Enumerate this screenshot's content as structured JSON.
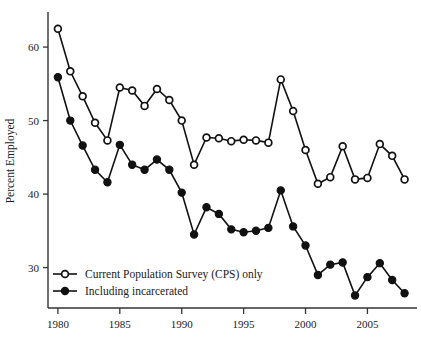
{
  "chart_data": {
    "type": "line",
    "title": "",
    "xlabel": "",
    "ylabel": "Percent Employed",
    "xlim": [
      1979.2,
      2008.6
    ],
    "ylim": [
      24.5,
      64.5
    ],
    "grid": false,
    "legend_position": "bottom-left",
    "x_ticks": [
      1980,
      1985,
      1990,
      1995,
      2000,
      2005
    ],
    "y_ticks": [
      30,
      40,
      50,
      60
    ],
    "x": [
      1980,
      1981,
      1982,
      1983,
      1984,
      1985,
      1986,
      1987,
      1988,
      1989,
      1990,
      1991,
      1992,
      1993,
      1994,
      1995,
      1996,
      1997,
      1998,
      1999,
      2000,
      2001,
      2002,
      2003,
      2004,
      2005,
      2006,
      2007,
      2008
    ],
    "series": [
      {
        "name": "Current Population Survey (CPS) only",
        "marker": "open-circle",
        "values": [
          62.5,
          56.7,
          53.3,
          49.7,
          47.3,
          54.5,
          54.1,
          52.0,
          54.3,
          52.8,
          50.0,
          44.0,
          47.7,
          47.6,
          47.2,
          47.4,
          47.3,
          47.0,
          55.6,
          51.3,
          46.0,
          41.4,
          42.3,
          46.5,
          42.0,
          42.2,
          46.8,
          45.2,
          42.0
        ]
      },
      {
        "name": "Including incarcerated",
        "marker": "filled-circle",
        "values": [
          55.9,
          50.0,
          46.6,
          43.3,
          41.6,
          46.7,
          44.0,
          43.3,
          44.7,
          43.3,
          40.2,
          34.5,
          38.2,
          37.3,
          35.2,
          34.8,
          35.0,
          35.4,
          40.5,
          35.6,
          33.0,
          29.0,
          30.4,
          30.7,
          26.2,
          28.7,
          30.6,
          28.3,
          26.5
        ]
      }
    ]
  },
  "legend": {
    "items": [
      {
        "label": "Current Population Survey (CPS) only",
        "marker": "open-circle"
      },
      {
        "label": "Including incarcerated",
        "marker": "filled-circle"
      }
    ]
  },
  "axes": {
    "y_label": "Percent Employed",
    "y_tick_labels": [
      "30",
      "40",
      "50",
      "60"
    ],
    "x_tick_labels": [
      "1980",
      "1985",
      "1990",
      "1995",
      "2000",
      "2005"
    ]
  },
  "colors": {
    "series": "#111111",
    "axis": "#333333",
    "background": "#ffffff"
  }
}
